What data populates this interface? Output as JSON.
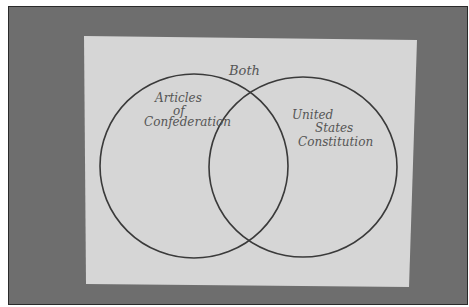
{
  "diagram": {
    "type": "venn",
    "labels": {
      "overlap": "Both",
      "left": [
        "Articles",
        "of",
        "Confederation"
      ],
      "right": [
        "United",
        "States",
        "Constitution"
      ]
    },
    "colors": {
      "background": "#6e6e6e",
      "paper": "#d6d6d6",
      "stroke": "#3a3a3a",
      "text": "#555555"
    }
  }
}
